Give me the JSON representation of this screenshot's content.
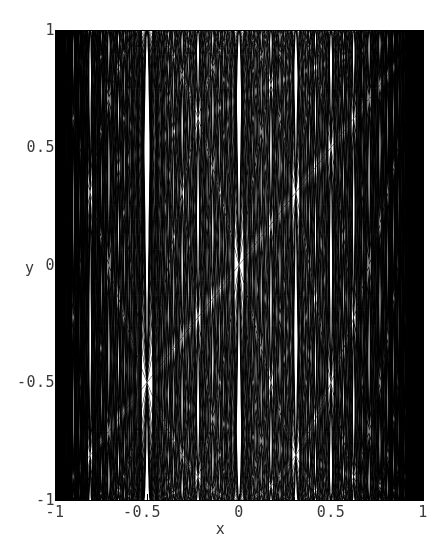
{
  "figure": {
    "background_color": "#ffffff",
    "ink_color": "#000000",
    "label_color": "#3a3a3a",
    "width_px": 441,
    "height_px": 550
  },
  "axes": {
    "x_axis_title": "x",
    "y_axis_title": "y",
    "x_tick_labels": [
      "-1",
      "-0.5",
      "0",
      "0.5",
      "1"
    ],
    "y_tick_labels": [
      "1",
      "0.5",
      "0",
      "-0.5",
      "-1"
    ],
    "x_tick_values": [
      -1,
      -0.5,
      0,
      0.5,
      1
    ],
    "y_tick_values": [
      1,
      0.5,
      0,
      -0.5,
      -1
    ],
    "x_minor_count_between": 4,
    "y_minor_count_between": 4
  },
  "chart_data": {
    "type": "line",
    "title": "",
    "subtitle": "",
    "xlabel": "x",
    "ylabel": "y",
    "xlim": [
      -1,
      1
    ],
    "ylim": [
      -1,
      1
    ],
    "xticks": [
      -1,
      -0.5,
      0,
      0.5,
      1
    ],
    "yticks": [
      -1,
      -0.5,
      0,
      0.5,
      1
    ],
    "xticklabels": [
      "-1",
      "-0.5",
      "0",
      "0.5",
      "1"
    ],
    "yticklabels": [
      "-1",
      "-0.5",
      "0",
      "0.5",
      "1"
    ],
    "grid": false,
    "legend": false,
    "legend_position": "none",
    "frame": true,
    "line_color": "#000000",
    "line_width": 0.5,
    "family": "chebyshev_T",
    "n_min": 1,
    "n_max": 60,
    "n_curves": 60,
    "samples_per_curve": 1400,
    "series": [
      {
        "name": "T_1",
        "n": 1
      },
      {
        "name": "T_2",
        "n": 2
      },
      {
        "name": "T_3",
        "n": 3
      },
      {
        "name": "T_4",
        "n": 4
      },
      {
        "name": "T_5",
        "n": 5
      },
      {
        "name": "T_6",
        "n": 6
      },
      {
        "name": "T_7",
        "n": 7
      },
      {
        "name": "T_8",
        "n": 8
      },
      {
        "name": "T_9",
        "n": 9
      },
      {
        "name": "T_10",
        "n": 10
      },
      {
        "name": "T_11",
        "n": 11
      },
      {
        "name": "T_12",
        "n": 12
      },
      {
        "name": "T_13",
        "n": 13
      },
      {
        "name": "T_14",
        "n": 14
      },
      {
        "name": "T_15",
        "n": 15
      },
      {
        "name": "T_16",
        "n": 16
      },
      {
        "name": "T_17",
        "n": 17
      },
      {
        "name": "T_18",
        "n": 18
      },
      {
        "name": "T_19",
        "n": 19
      },
      {
        "name": "T_20",
        "n": 20
      },
      {
        "name": "T_21",
        "n": 21
      },
      {
        "name": "T_22",
        "n": 22
      },
      {
        "name": "T_23",
        "n": 23
      },
      {
        "name": "T_24",
        "n": 24
      },
      {
        "name": "T_25",
        "n": 25
      },
      {
        "name": "T_26",
        "n": 26
      },
      {
        "name": "T_27",
        "n": 27
      },
      {
        "name": "T_28",
        "n": 28
      },
      {
        "name": "T_29",
        "n": 29
      },
      {
        "name": "T_30",
        "n": 30
      },
      {
        "name": "T_31",
        "n": 31
      },
      {
        "name": "T_32",
        "n": 32
      },
      {
        "name": "T_33",
        "n": 33
      },
      {
        "name": "T_34",
        "n": 34
      },
      {
        "name": "T_35",
        "n": 35
      },
      {
        "name": "T_36",
        "n": 36
      },
      {
        "name": "T_37",
        "n": 37
      },
      {
        "name": "T_38",
        "n": 38
      },
      {
        "name": "T_39",
        "n": 39
      },
      {
        "name": "T_40",
        "n": 40
      },
      {
        "name": "T_41",
        "n": 41
      },
      {
        "name": "T_42",
        "n": 42
      },
      {
        "name": "T_43",
        "n": 43
      },
      {
        "name": "T_44",
        "n": 44
      },
      {
        "name": "T_45",
        "n": 45
      },
      {
        "name": "T_46",
        "n": 46
      },
      {
        "name": "T_47",
        "n": 47
      },
      {
        "name": "T_48",
        "n": 48
      },
      {
        "name": "T_49",
        "n": 49
      },
      {
        "name": "T_50",
        "n": 50
      },
      {
        "name": "T_51",
        "n": 51
      },
      {
        "name": "T_52",
        "n": 52
      },
      {
        "name": "T_53",
        "n": 53
      },
      {
        "name": "T_54",
        "n": 54
      },
      {
        "name": "T_55",
        "n": 55
      },
      {
        "name": "T_56",
        "n": 56
      },
      {
        "name": "T_57",
        "n": 57
      },
      {
        "name": "T_58",
        "n": 58
      },
      {
        "name": "T_59",
        "n": 59
      },
      {
        "name": "T_60",
        "n": 60
      }
    ]
  }
}
